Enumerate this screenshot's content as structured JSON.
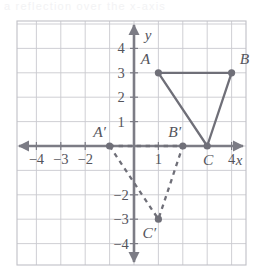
{
  "figure": {
    "top_fragment_text": "a reflection over the x-axis",
    "axis_labels": {
      "x": "x",
      "y": "y"
    },
    "x_tick_labels": [
      {
        "value": -4,
        "label": "−4"
      },
      {
        "value": -3,
        "label": "−3"
      },
      {
        "value": -2,
        "label": "−2"
      },
      {
        "value": 1,
        "label": "1"
      },
      {
        "value": 4,
        "label": "4"
      }
    ],
    "y_tick_labels": [
      {
        "value": 4,
        "label": "4"
      },
      {
        "value": 3,
        "label": "3"
      },
      {
        "value": 2,
        "label": "2"
      },
      {
        "value": 1,
        "label": "1"
      },
      {
        "value": -2,
        "label": "−2"
      },
      {
        "value": -3,
        "label": "−3"
      },
      {
        "value": -4,
        "label": "−4"
      }
    ],
    "points": [
      {
        "name": "A",
        "label": "A",
        "x": 1,
        "y": 3
      },
      {
        "name": "B",
        "label": "B",
        "x": 4,
        "y": 3
      },
      {
        "name": "C",
        "label": "C",
        "x": 3,
        "y": 0
      },
      {
        "name": "A'",
        "label": "A′",
        "x": -1,
        "y": 0
      },
      {
        "name": "B'",
        "label": "B′",
        "x": 2,
        "y": 0
      },
      {
        "name": "C'",
        "label": "C′",
        "x": 1,
        "y": -3
      }
    ],
    "shapes": [
      {
        "name": "triangle-ABC",
        "vertices": [
          "A",
          "B",
          "C"
        ],
        "style": "solid"
      },
      {
        "name": "triangle-ABC-prime",
        "vertices": [
          "A'",
          "B'",
          "C'"
        ],
        "style": "dashed"
      }
    ],
    "colors": {
      "grid": "#c9c9cf",
      "axis": "#7c7c85",
      "shape": "#6f6f78",
      "label": "#55555c",
      "border": "#c0c0c6"
    },
    "grid": {
      "x_min": -4.5,
      "x_max": 4.9,
      "y_min": -4.9,
      "y_max": 5.1,
      "visible": true
    }
  }
}
